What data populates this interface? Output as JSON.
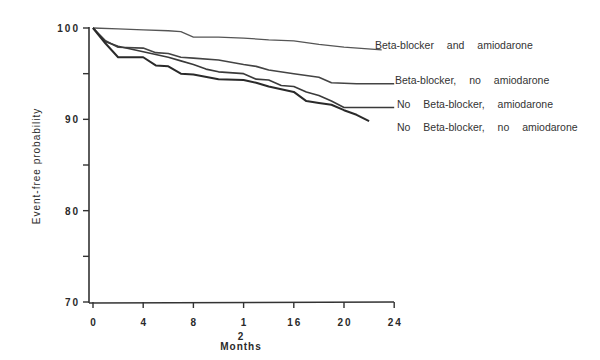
{
  "chart_data": {
    "type": "line",
    "subtype": "kaplan-meier step curves",
    "title": "",
    "xlabel_lines": [
      "2",
      "Months"
    ],
    "xlabel": "Months",
    "ylabel": "Event-free probability",
    "xlim": [
      0,
      24
    ],
    "ylim": [
      70,
      100
    ],
    "xticks": [
      0,
      4,
      8,
      12,
      16,
      20,
      24
    ],
    "xtick_labels": [
      "0",
      "4",
      "8",
      "1",
      "16",
      "20",
      "24"
    ],
    "yticks": [
      70,
      75,
      80,
      85,
      90,
      95,
      100
    ],
    "ytick_labels": [
      "70",
      "",
      "80",
      "",
      "90",
      "",
      "100"
    ],
    "grid": false,
    "legend_position": "right, inline labels at curve ends",
    "series": [
      {
        "name": "Beta-blocker and amiodarone",
        "color": "#555555",
        "width": 1.3,
        "x": [
          0,
          2,
          4,
          6,
          7,
          8,
          10,
          12,
          14,
          16,
          18,
          20,
          23
        ],
        "y": [
          100,
          99.9,
          99.8,
          99.7,
          99.6,
          99.0,
          99.0,
          98.9,
          98.7,
          98.6,
          98.2,
          97.9,
          97.6
        ],
        "label_x": 375,
        "label_y": 49,
        "line_end_px": 376
      },
      {
        "name": "Beta-blocker, no amiodarone",
        "color": "#444444",
        "width": 1.6,
        "x": [
          0,
          1,
          2,
          4,
          5,
          6,
          7,
          8,
          10,
          12,
          13,
          14,
          16,
          18,
          19,
          21,
          24
        ],
        "y": [
          100,
          98.6,
          97.9,
          97.8,
          97.3,
          97.2,
          96.8,
          96.7,
          96.5,
          96.0,
          95.8,
          95.4,
          95.0,
          94.6,
          94.0,
          93.9,
          93.9
        ],
        "label_x": 395,
        "label_y": 84,
        "line_end_px": 393
      },
      {
        "name": "No Beta-blocker, amiodarone",
        "color": "#3a3a3a",
        "width": 1.6,
        "x": [
          0,
          1,
          2,
          3,
          4,
          6,
          7,
          8,
          9,
          10,
          12,
          13,
          14,
          15,
          16,
          17,
          18,
          19,
          20,
          24
        ],
        "y": [
          100,
          98.5,
          98.0,
          97.7,
          97.4,
          96.8,
          96.4,
          96.0,
          95.5,
          95.2,
          95.0,
          94.4,
          94.3,
          93.7,
          93.6,
          93.0,
          92.6,
          92.0,
          91.3,
          91.3
        ],
        "label_x": 397,
        "label_y": 108,
        "line_end_px": 388
      },
      {
        "name": "No Beta-blocker, no amiodarone",
        "color": "#2a2a2a",
        "width": 2.0,
        "x": [
          0,
          1,
          2,
          4,
          5,
          6,
          7,
          8,
          10,
          12,
          13,
          14,
          16,
          17,
          18,
          19,
          20,
          21,
          22
        ],
        "y": [
          100,
          98.3,
          96.8,
          96.8,
          95.9,
          95.8,
          95.0,
          94.9,
          94.4,
          94.3,
          94.0,
          93.6,
          93.0,
          92.0,
          91.8,
          91.6,
          91.0,
          90.5,
          89.8
        ],
        "label_x": 397,
        "label_y": 131,
        "line_end_px": null
      }
    ]
  }
}
